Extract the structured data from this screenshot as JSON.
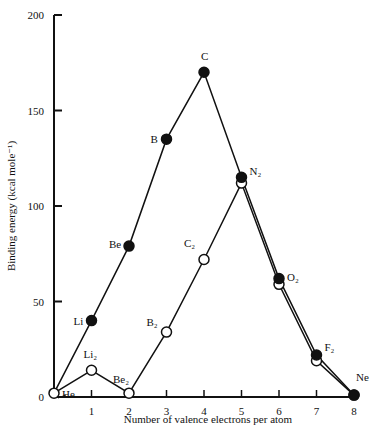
{
  "chart_data": {
    "type": "line",
    "title": "",
    "xlabel": "Number of valence electrons per atom",
    "ylabel": "Binding energy (kcal mole⁻¹)",
    "xlim": [
      0,
      8
    ],
    "ylim": [
      0,
      200
    ],
    "x_ticks": [
      "1",
      "2",
      "3",
      "4",
      "5",
      "6",
      "7",
      "8"
    ],
    "y_ticks": [
      "0",
      "50",
      "100",
      "150",
      "200"
    ],
    "grid": false,
    "legend": null,
    "series": [
      {
        "name": "Atoms (filled circles)",
        "marker": "filled-circle",
        "x": [
          0,
          1,
          2,
          3,
          4,
          5,
          6,
          7,
          8
        ],
        "values": [
          2,
          40,
          79,
          135,
          170,
          115,
          62,
          22,
          1
        ],
        "labels": [
          "",
          "Li",
          "Be",
          "B",
          "C",
          "N₂",
          "O₂",
          "F₂",
          "Ne"
        ]
      },
      {
        "name": "Diatomic molecules (open circles)",
        "marker": "open-circle",
        "x": [
          0,
          1,
          2,
          3,
          4,
          5,
          6,
          7,
          8
        ],
        "values": [
          2,
          14,
          2,
          34,
          72,
          112,
          59,
          19,
          1
        ],
        "labels": [
          "He",
          "Li₂",
          "Be₂",
          "B₂",
          "C₂",
          "",
          "",
          "",
          ""
        ]
      }
    ],
    "annotations": [
      "Li",
      "Be",
      "B",
      "C",
      "N₂",
      "O₂",
      "F₂",
      "Ne",
      "He",
      "Li₂",
      "Be₂",
      "B₂",
      "C₂"
    ]
  },
  "axes": {
    "xlabel": "Number of valence electrons per atom",
    "ylabel": "Binding energy (kcal mole⁻¹)"
  }
}
